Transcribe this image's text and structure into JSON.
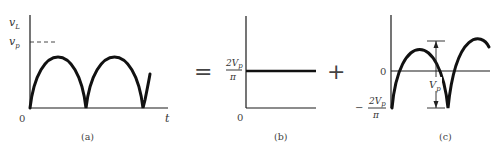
{
  "figure": {
    "panels": [
      {
        "id": "a",
        "caption": "(a)",
        "y_label": "v",
        "y_label_sub": "L",
        "peak_label": "v",
        "peak_label_sub": "p",
        "origin_label": "0",
        "x_label": "t",
        "description": "Full-wave rectified sine output v_L(t)"
      },
      {
        "id": "b",
        "caption": "(b)",
        "level_numerator": "2V",
        "level_numerator_sub": "p",
        "level_denominator": "π",
        "origin_label": "0",
        "description": "DC component 2Vp/π"
      },
      {
        "id": "c",
        "caption": "(c)",
        "zero_label": "0",
        "min_label_sign": "−",
        "min_label_numerator": "2V",
        "min_label_numerator_sub": "p",
        "min_label_denominator": "π",
        "amplitude_label": "V",
        "amplitude_label_sub": "p",
        "description": "Ripple (AC) component swinging from −2Vp/π, peak-to-peak Vp"
      }
    ],
    "operators": {
      "equals": "=",
      "plus": "+"
    }
  }
}
